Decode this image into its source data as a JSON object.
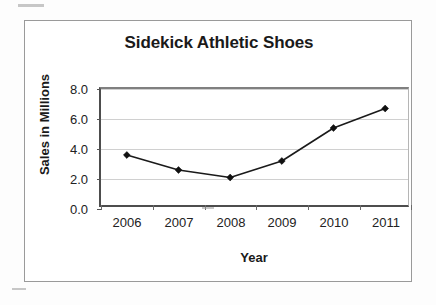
{
  "chart_data": {
    "type": "line",
    "title": "Sidekick Athletic Shoes",
    "xlabel": "Year",
    "ylabel": "Sales in Millions",
    "categories": [
      "2006",
      "2007",
      "2008",
      "2009",
      "2010",
      "2011"
    ],
    "values": [
      3.6,
      2.6,
      2.1,
      3.2,
      5.4,
      6.7
    ],
    "series": [
      {
        "name": "Sales in Millions",
        "values": [
          3.6,
          2.6,
          2.1,
          3.2,
          5.4,
          6.7
        ]
      }
    ],
    "ylim": [
      0.0,
      8.0
    ],
    "ytick_labels": [
      "0.0",
      "2.0",
      "4.0",
      "6.0",
      "8.0"
    ],
    "ytick_values": [
      0.0,
      2.0,
      4.0,
      6.0,
      8.0
    ],
    "xtick_labels": [
      "2006",
      "2007",
      "2008",
      "2009",
      "2010",
      "2011"
    ],
    "grid": true,
    "legend": "none",
    "marker": "diamond",
    "line_color": "#1a1a1a",
    "marker_color": "#111111",
    "grid_color": "#d0d0d0",
    "axis_color": "#4d4d4d",
    "background_color": "#ffffff"
  }
}
